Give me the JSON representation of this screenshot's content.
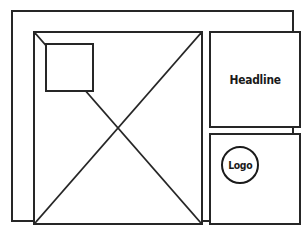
{
  "document": {
    "type": "layout-wireframe",
    "title": "Page Layout Wireframe",
    "background_color": "#ffffff",
    "line_color": "#262626",
    "text_color": "#1a1a1a"
  },
  "frame": {
    "name": "page-border"
  },
  "main_panel": {
    "name": "image-placeholder",
    "cross_marker": "diagonal-x",
    "inset": {
      "name": "inset-square"
    }
  },
  "right_column": {
    "headline_panel": {
      "text": "Headline"
    },
    "logo_panel": {
      "badge_text": "Logo"
    }
  }
}
